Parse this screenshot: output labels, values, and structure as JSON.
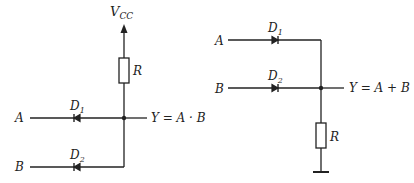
{
  "and_gate": {
    "supply_label": "V",
    "supply_sub": "CC",
    "resistor_label": "R",
    "inputs": [
      {
        "label": "A",
        "diode_label": "D",
        "diode_sub": "1"
      },
      {
        "label": "B",
        "diode_label": "D",
        "diode_sub": "2"
      }
    ],
    "output_label": "Y = A · B"
  },
  "or_gate": {
    "resistor_label": "R",
    "inputs": [
      {
        "label": "A",
        "diode_label": "D",
        "diode_sub": "1"
      },
      {
        "label": "B",
        "diode_label": "D",
        "diode_sub": "2"
      }
    ],
    "output_label": "Y = A + B"
  },
  "colors": {
    "line": "#222222",
    "background": "#ffffff"
  }
}
